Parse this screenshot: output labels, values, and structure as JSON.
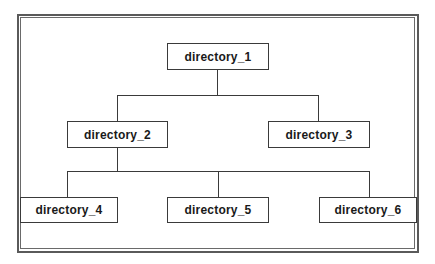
{
  "diagram": {
    "type": "directory-tree",
    "nodes": [
      {
        "id": "directory_1",
        "label": "directory_1",
        "parent": null
      },
      {
        "id": "directory_2",
        "label": "directory_2",
        "parent": "directory_1"
      },
      {
        "id": "directory_3",
        "label": "directory_3",
        "parent": "directory_1"
      },
      {
        "id": "directory_4",
        "label": "directory_4",
        "parent": "directory_2"
      },
      {
        "id": "directory_5",
        "label": "directory_5",
        "parent": "directory_2"
      },
      {
        "id": "directory_6",
        "label": "directory_6",
        "parent": "directory_2"
      }
    ],
    "colors": {
      "line": "#3a3a3a",
      "frame": "#5a5a5a",
      "text": "#1a1a1a",
      "background": "#ffffff"
    }
  }
}
